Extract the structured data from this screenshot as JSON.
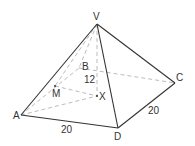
{
  "diagram": {
    "type": "square-based pyramid",
    "vertices": {
      "V": {
        "label": "V",
        "x": 97,
        "y": 24
      },
      "A": {
        "label": "A",
        "x": 21,
        "y": 115
      },
      "B": {
        "label": "B",
        "x": 79,
        "y": 68
      },
      "C": {
        "label": "C",
        "x": 175,
        "y": 83
      },
      "D": {
        "label": "D",
        "x": 118,
        "y": 128
      },
      "X": {
        "label": "X",
        "x": 97,
        "y": 96
      },
      "M": {
        "label": "M",
        "x": 55,
        "y": 86
      }
    },
    "measurements": {
      "AD": "20",
      "DC": "20",
      "VX": "12"
    },
    "colors": {
      "solid": "#333333",
      "dashed": "#aaaaaa"
    }
  }
}
